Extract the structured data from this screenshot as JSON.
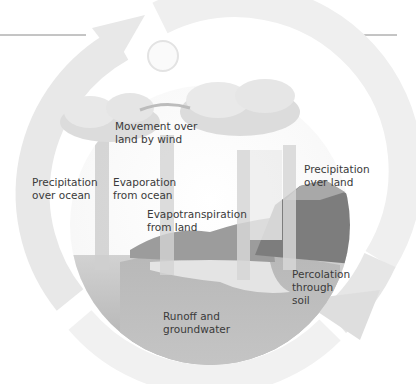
{
  "diagram": {
    "colors": {
      "cycle_arrow": "#e6e6e6",
      "cloud": "#d8d8d8",
      "ground": "#9a9a9a",
      "ocean": "#bdbdbd",
      "text": "#3a3a3a"
    },
    "labels": {
      "movement_over_land": [
        "Movement over",
        "land by wind"
      ],
      "precip_ocean": [
        "Precipitation",
        "over ocean"
      ],
      "evap_ocean": [
        "Evaporation",
        "from ocean"
      ],
      "evapotranspiration": [
        "Evapotranspiration",
        "from land"
      ],
      "precip_land": [
        "Precipitation",
        "over land"
      ],
      "percolation": [
        "Percolation",
        "through",
        "soil"
      ],
      "runoff": [
        "Runoff and",
        "groundwater"
      ]
    },
    "elements": [
      "sun",
      "ocean-cloud",
      "land-cloud",
      "mountain",
      "lake",
      "ocean",
      "circular-cycle-arrow"
    ]
  }
}
